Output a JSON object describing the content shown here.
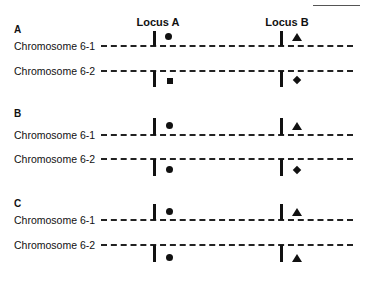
{
  "headers": {
    "locus_a": "Locus A",
    "locus_b": "Locus B"
  },
  "panels": [
    {
      "label": "A",
      "chromosomes": [
        {
          "label": "Chromosome 6-1",
          "locus_a_marker": "circle",
          "locus_b_marker": "triangle"
        },
        {
          "label": "Chromosome 6-2",
          "locus_a_marker": "square",
          "locus_b_marker": "diamond"
        }
      ]
    },
    {
      "label": "B",
      "chromosomes": [
        {
          "label": "Chromosome 6-1",
          "locus_a_marker": "circle",
          "locus_b_marker": "triangle"
        },
        {
          "label": "Chromosome 6-2",
          "locus_a_marker": "circle",
          "locus_b_marker": "diamond"
        }
      ]
    },
    {
      "label": "C",
      "chromosomes": [
        {
          "label": "Chromosome 6-1",
          "locus_a_marker": "circle",
          "locus_b_marker": "triangle"
        },
        {
          "label": "Chromosome 6-2",
          "locus_a_marker": "circle",
          "locus_b_marker": "triangle"
        }
      ]
    }
  ],
  "colors": {
    "ink": "#111111",
    "background": "#ffffff"
  }
}
